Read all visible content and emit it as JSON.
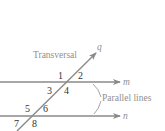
{
  "diagram": {
    "labels": {
      "transversal": "Transversal",
      "parallel_lines": "Parallel lines"
    },
    "lines": {
      "m": "m",
      "n": "n",
      "q": "q"
    },
    "angles": [
      "1",
      "2",
      "3",
      "4",
      "5",
      "6",
      "7",
      "8"
    ],
    "colors": {
      "line": "#8a8a8a",
      "label": "#8f8f8f",
      "angle_number": "#333333"
    }
  }
}
